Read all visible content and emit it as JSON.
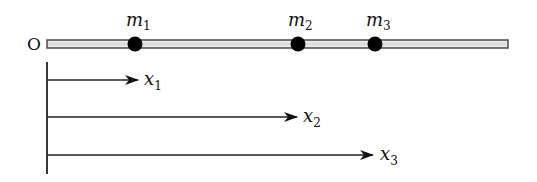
{
  "diagram": {
    "origin_label": "O",
    "rod": {
      "x_start": 47,
      "x_end": 508,
      "y": 44,
      "fill": "#e6e6e6",
      "stroke": "#555555"
    },
    "masses": [
      {
        "id": "m1",
        "label": "m",
        "subscript": "1",
        "x": 135
      },
      {
        "id": "m2",
        "label": "m",
        "subscript": "2",
        "x": 298
      },
      {
        "id": "m3",
        "label": "m",
        "subscript": "3",
        "x": 375
      }
    ],
    "arrows": [
      {
        "id": "x1",
        "label": "x",
        "subscript": "1",
        "y": 80,
        "x_end": 138
      },
      {
        "id": "x2",
        "label": "x",
        "subscript": "2",
        "y": 117,
        "x_end": 297
      },
      {
        "id": "x3",
        "label": "x",
        "subscript": "3",
        "y": 155,
        "x_end": 373
      }
    ],
    "colors": {
      "ink": "#111111",
      "rod_fill": "#e6e6e6",
      "rod_edge": "#555555",
      "mass": "#000000"
    }
  }
}
